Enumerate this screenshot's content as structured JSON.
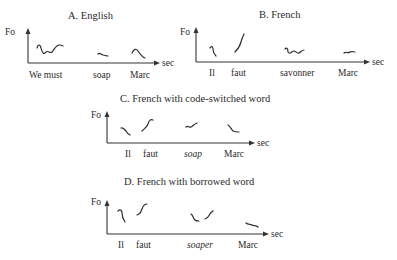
{
  "figure": {
    "y_axis_label": "Fo",
    "x_axis_label": "sec",
    "panels": [
      {
        "id": "A",
        "title": "A.  English",
        "words": [
          {
            "text": "We must",
            "italic": false
          },
          {
            "text": "soap",
            "italic": false
          },
          {
            "text": "Marc",
            "italic": false
          }
        ]
      },
      {
        "id": "B",
        "title": "B.  French",
        "words": [
          {
            "text": "Il",
            "italic": false
          },
          {
            "text": "faut",
            "italic": false
          },
          {
            "text": "savonner",
            "italic": false
          },
          {
            "text": "Marc",
            "italic": false
          }
        ]
      },
      {
        "id": "C",
        "title": "C.  French with code-switched word",
        "words": [
          {
            "text": "Il",
            "italic": false
          },
          {
            "text": "faut",
            "italic": false
          },
          {
            "text": "soap",
            "italic": true
          },
          {
            "text": "Marc",
            "italic": false
          }
        ]
      },
      {
        "id": "D",
        "title": "D.  French with borrowed word",
        "words": [
          {
            "text": "Il",
            "italic": false
          },
          {
            "text": "faut",
            "italic": false
          },
          {
            "text": "soaper",
            "italic": true
          },
          {
            "text": "Marc",
            "italic": false
          }
        ]
      }
    ]
  }
}
